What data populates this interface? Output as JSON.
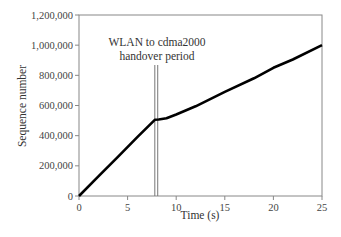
{
  "chart_data": {
    "type": "line",
    "title": "",
    "xlabel": "Time (s)",
    "ylabel": "Sequence number",
    "xlim": [
      0,
      25
    ],
    "ylim": [
      0,
      1200000
    ],
    "x_ticks": [
      "0",
      "5",
      "10",
      "15",
      "20",
      "25"
    ],
    "y_ticks": [
      "0",
      "200,000",
      "400,000",
      "600,000",
      "800,000",
      "1,000,000",
      "1,200,000"
    ],
    "grid": false,
    "legend": null,
    "series": [
      {
        "name": "Sequence number",
        "x": [
          0,
          2,
          4,
          6,
          7.8,
          8.2,
          9,
          10,
          12,
          15,
          18,
          20,
          22,
          25
        ],
        "y": [
          0,
          130000,
          260000,
          390000,
          505000,
          507000,
          515000,
          540000,
          595000,
          690000,
          780000,
          850000,
          905000,
          1000000
        ]
      }
    ],
    "annotations": [
      {
        "text_line1": "WLAN to cdma2000",
        "text_line2": "handover period",
        "x_start": 7.8,
        "x_end": 8.1
      }
    ]
  }
}
